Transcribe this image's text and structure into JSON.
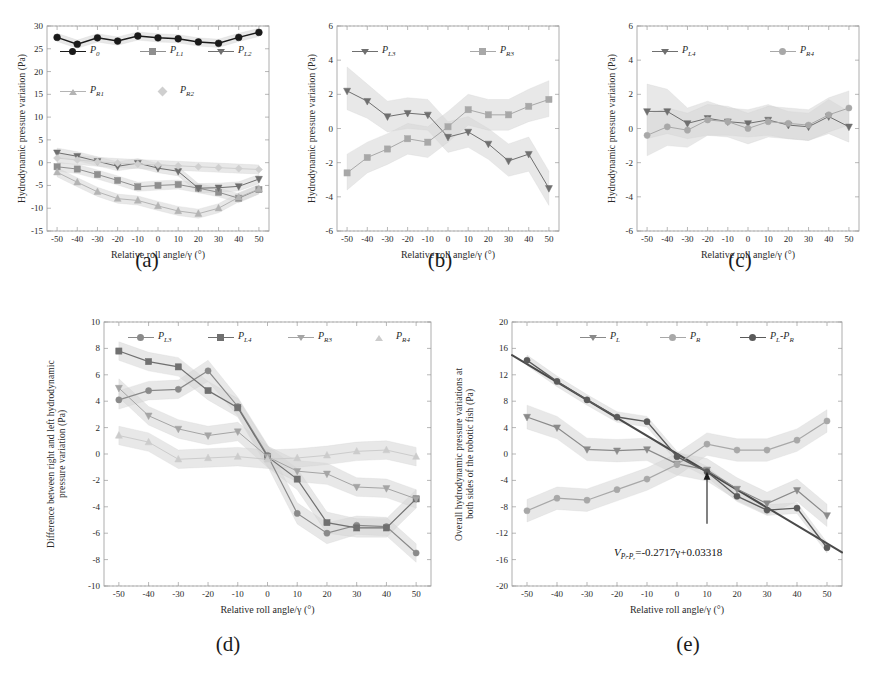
{
  "figure": {
    "axis_x_label": "Relative roll angle/γ (°)",
    "x_ticks": [
      "-50",
      "-40",
      "-30",
      "-20",
      "-10",
      "0",
      "10",
      "20",
      "30",
      "40",
      "50"
    ],
    "panel_labels": {
      "a": "(a)",
      "b": "(b)",
      "c": "(c)",
      "d": "(d)",
      "e": "(e)"
    }
  },
  "colors": {
    "black": "#1a1a1a",
    "gray_dark": "#6f6f6f",
    "gray_mid": "#8f8f8f",
    "gray_light": "#b4b4b4",
    "gray_faint": "#cfcfcf",
    "band": "#d9d9d9",
    "frame": "#9a9a9a"
  },
  "chart_data": [
    {
      "id": "panel_a",
      "type": "line",
      "title": "(a)",
      "xlabel": "Relative roll angle/γ (°)",
      "ylabel": "Hydrodynamic pressure variation (Pa)",
      "x": [
        -50,
        -40,
        -30,
        -20,
        -10,
        0,
        10,
        20,
        30,
        40,
        50
      ],
      "xlim": [
        -55,
        55
      ],
      "ylim": [
        -15,
        30
      ],
      "yticks": [
        -15,
        -10,
        -5,
        0,
        5,
        10,
        15,
        20,
        25,
        30
      ],
      "grid": false,
      "legend_position": "inside-upper",
      "series": [
        {
          "name": "P_0",
          "label": "P",
          "sub": "0",
          "values": [
            27.5,
            26.0,
            27.4,
            26.7,
            27.8,
            27.4,
            27.2,
            26.5,
            26.2,
            27.5,
            28.6
          ],
          "band_lo": [
            26.6,
            25.1,
            26.5,
            25.8,
            26.9,
            26.5,
            26.3,
            25.6,
            25.3,
            26.6,
            27.7
          ],
          "band_hi": [
            28.4,
            26.9,
            28.3,
            27.6,
            28.7,
            28.3,
            28.1,
            27.4,
            27.1,
            28.4,
            29.5
          ],
          "color": "#1a1a1a",
          "marker": "circle",
          "width": 1.5
        },
        {
          "name": "P_L1",
          "label": "P",
          "sub": "L1",
          "values": [
            -0.9,
            -1.4,
            -2.6,
            -3.9,
            -5.3,
            -5.0,
            -4.8,
            -5.6,
            -6.5,
            -7.8,
            -5.9
          ],
          "band_lo": [
            -1.9,
            -2.4,
            -3.6,
            -4.9,
            -6.3,
            -6.0,
            -5.8,
            -6.6,
            -7.5,
            -8.8,
            -6.9
          ],
          "band_hi": [
            0.1,
            -0.4,
            -1.6,
            -2.9,
            -4.3,
            -4.0,
            -3.8,
            -4.6,
            -5.5,
            -6.8,
            -4.9
          ],
          "color": "#8f8f8f",
          "marker": "square",
          "width": 1.0
        },
        {
          "name": "P_L2",
          "label": "P",
          "sub": "L2",
          "values": [
            2.2,
            1.4,
            0.3,
            -0.8,
            -0.1,
            -1.2,
            -1.9,
            -5.6,
            -5.5,
            -5.2,
            -3.6
          ],
          "band_lo": [
            1.2,
            0.4,
            -0.7,
            -1.8,
            -1.1,
            -2.2,
            -2.9,
            -6.6,
            -6.5,
            -6.2,
            -4.6
          ],
          "band_hi": [
            3.2,
            2.4,
            1.3,
            0.2,
            0.9,
            -0.2,
            -0.9,
            -4.6,
            -4.5,
            -4.2,
            -2.6
          ],
          "color": "#6f6f6f",
          "marker": "triangle-down",
          "width": 1.0
        },
        {
          "name": "P_R1",
          "label": "P",
          "sub": "R1",
          "values": [
            -2.1,
            -4.3,
            -6.4,
            -7.9,
            -8.3,
            -9.5,
            -10.6,
            -11.2,
            -10.0,
            -7.6,
            -5.8
          ],
          "band_lo": [
            -3.1,
            -5.3,
            -7.4,
            -8.9,
            -9.3,
            -10.5,
            -11.6,
            -12.2,
            -11.0,
            -8.6,
            -6.8
          ],
          "band_hi": [
            -1.1,
            -3.3,
            -5.4,
            -6.9,
            -7.3,
            -8.5,
            -9.6,
            -10.2,
            -9.0,
            -6.6,
            -4.8
          ],
          "color": "#b4b4b4",
          "marker": "triangle-up",
          "width": 1.0
        },
        {
          "name": "P_R2",
          "label": "P",
          "sub": "R2",
          "values": [
            1.0,
            0.6,
            0.2,
            -0.1,
            -0.3,
            -0.5,
            -0.7,
            -0.9,
            -1.1,
            -1.3,
            -1.5
          ],
          "band_lo": [
            0.0,
            -0.4,
            -0.8,
            -1.1,
            -1.3,
            -1.5,
            -1.7,
            -1.9,
            -2.1,
            -2.3,
            -2.5
          ],
          "band_hi": [
            2.0,
            1.6,
            1.2,
            0.9,
            0.7,
            0.5,
            0.3,
            0.1,
            -0.1,
            -0.3,
            -0.5
          ],
          "color": "#cfcfcf",
          "marker": "diamond",
          "width": 1.0
        }
      ]
    },
    {
      "id": "panel_b",
      "type": "line",
      "title": "(b)",
      "xlabel": "Relative roll angle/γ (°)",
      "ylabel": "Hydrodynamic pressure variation (Pa)",
      "x": [
        -50,
        -40,
        -30,
        -20,
        -10,
        0,
        10,
        20,
        30,
        40,
        50
      ],
      "xlim": [
        -55,
        55
      ],
      "ylim": [
        -6,
        6
      ],
      "yticks": [
        -6,
        -4,
        -2,
        0,
        2,
        4,
        6
      ],
      "grid": false,
      "legend_position": "inside-upper",
      "series": [
        {
          "name": "P_L3",
          "label": "P",
          "sub": "L3",
          "values": [
            2.2,
            1.6,
            0.7,
            0.9,
            0.8,
            -0.5,
            -0.2,
            -0.9,
            -1.9,
            -1.5,
            -3.5
          ],
          "band_lo": [
            1.1,
            0.6,
            -0.2,
            0.0,
            -0.1,
            -1.4,
            -1.1,
            -1.8,
            -2.8,
            -2.5,
            -4.5
          ],
          "band_hi": [
            3.6,
            2.6,
            1.6,
            1.8,
            1.7,
            0.4,
            0.7,
            0.0,
            -0.9,
            -0.5,
            -2.5
          ],
          "color": "#6f6f6f",
          "marker": "triangle-down",
          "width": 1.0
        },
        {
          "name": "P_R3",
          "label": "P",
          "sub": "R3",
          "values": [
            -2.6,
            -1.7,
            -1.2,
            -0.6,
            -0.8,
            0.1,
            1.1,
            0.8,
            0.8,
            1.3,
            1.7
          ],
          "band_lo": [
            -3.6,
            -2.6,
            -2.1,
            -1.5,
            -1.7,
            -0.8,
            0.2,
            -0.1,
            -0.1,
            0.4,
            0.7
          ],
          "band_hi": [
            -1.5,
            -0.8,
            -0.3,
            0.3,
            0.1,
            1.0,
            2.0,
            1.7,
            1.7,
            2.3,
            2.8
          ],
          "color": "#a8a8a8",
          "marker": "square",
          "width": 1.0
        }
      ]
    },
    {
      "id": "panel_c",
      "type": "line",
      "title": "(c)",
      "xlabel": "Relative roll angle/γ (°)",
      "ylabel": "Hydrodynamic pressure variation (Pa)",
      "x": [
        -50,
        -40,
        -30,
        -20,
        -10,
        0,
        10,
        20,
        30,
        40,
        50
      ],
      "xlim": [
        -55,
        55
      ],
      "ylim": [
        -6,
        6
      ],
      "yticks": [
        -6,
        -4,
        -2,
        0,
        2,
        4,
        6
      ],
      "grid": false,
      "legend_position": "inside-upper",
      "series": [
        {
          "name": "P_L4",
          "label": "P",
          "sub": "L4",
          "values": [
            1.0,
            1.0,
            0.3,
            0.6,
            0.4,
            0.3,
            0.5,
            0.2,
            0.1,
            0.7,
            0.1
          ],
          "band_lo": [
            -0.6,
            -0.3,
            -0.6,
            -0.4,
            -0.4,
            -0.5,
            -0.4,
            -0.6,
            -0.7,
            -0.3,
            -0.8
          ],
          "band_hi": [
            2.6,
            2.3,
            1.2,
            1.6,
            1.2,
            1.1,
            1.4,
            1.0,
            0.9,
            1.7,
            1.0
          ],
          "color": "#6f6f6f",
          "marker": "triangle-down",
          "width": 1.0
        },
        {
          "name": "P_R4",
          "label": "P",
          "sub": "R4",
          "values": [
            -0.4,
            0.1,
            -0.1,
            0.5,
            0.4,
            0.0,
            0.4,
            0.3,
            0.2,
            0.8,
            1.2
          ],
          "band_lo": [
            -1.6,
            -1.0,
            -1.1,
            -0.4,
            -0.5,
            -0.9,
            -0.5,
            -0.6,
            -0.7,
            -0.2,
            0.2
          ],
          "band_hi": [
            0.8,
            1.2,
            0.9,
            1.4,
            1.3,
            0.9,
            1.3,
            1.2,
            1.1,
            1.8,
            2.2
          ],
          "color": "#a8a8a8",
          "marker": "circle",
          "width": 1.0
        }
      ]
    },
    {
      "id": "panel_d",
      "type": "line",
      "title": "(d)",
      "xlabel": "Relative roll angle/γ (°)",
      "ylabel": "Difference between right and left hydrodynamic\npressure variation (Pa)",
      "x": [
        -50,
        -40,
        -30,
        -20,
        -10,
        0,
        10,
        20,
        30,
        40,
        50
      ],
      "xlim": [
        -55,
        55
      ],
      "ylim": [
        -10,
        10
      ],
      "yticks": [
        -10,
        -8,
        -6,
        -4,
        -2,
        0,
        2,
        4,
        6,
        8,
        10
      ],
      "grid": false,
      "legend_position": "inside-top",
      "series": [
        {
          "name": "P_L3",
          "label": "P",
          "sub": "L3",
          "values": [
            4.1,
            4.8,
            4.9,
            6.3,
            3.6,
            -0.1,
            -4.5,
            -6.0,
            -5.4,
            -5.5,
            -7.5
          ],
          "band_lo": [
            3.4,
            4.1,
            4.2,
            5.5,
            2.9,
            -0.9,
            -5.3,
            -6.8,
            -6.1,
            -6.2,
            -8.2
          ],
          "band_hi": [
            4.8,
            5.5,
            5.6,
            7.1,
            4.3,
            0.7,
            -3.7,
            -5.2,
            -4.7,
            -4.8,
            -6.8
          ],
          "color": "#8a8a8a",
          "marker": "circle",
          "width": 1.2
        },
        {
          "name": "P_L4",
          "label": "P",
          "sub": "L4",
          "values": [
            7.8,
            7.0,
            6.6,
            4.8,
            3.5,
            -0.2,
            -1.9,
            -5.2,
            -5.6,
            -5.6,
            -3.4
          ],
          "band_lo": [
            7.1,
            6.3,
            5.9,
            4.1,
            2.8,
            -1.0,
            -2.7,
            -6.0,
            -6.3,
            -6.3,
            -4.1
          ],
          "band_hi": [
            8.5,
            7.7,
            7.3,
            5.5,
            4.2,
            0.6,
            -1.1,
            -4.4,
            -4.9,
            -4.9,
            -2.7
          ],
          "color": "#707070",
          "marker": "square",
          "width": 1.2
        },
        {
          "name": "P_R3",
          "label": "P",
          "sub": "R3",
          "values": [
            5.0,
            2.9,
            1.9,
            1.4,
            1.7,
            -0.2,
            -1.3,
            -1.5,
            -2.5,
            -2.6,
            -3.4
          ],
          "band_lo": [
            4.3,
            2.2,
            1.2,
            0.7,
            1.0,
            -1.0,
            -2.1,
            -2.3,
            -3.2,
            -3.3,
            -4.1
          ],
          "band_hi": [
            5.7,
            3.6,
            2.6,
            2.1,
            2.4,
            0.6,
            -0.5,
            -0.7,
            -1.8,
            -1.9,
            -2.7
          ],
          "color": "#a5a5a5",
          "marker": "triangle-down",
          "width": 1.0
        },
        {
          "name": "P_R4",
          "label": "P",
          "sub": "R4",
          "values": [
            1.4,
            0.9,
            -0.4,
            -0.3,
            -0.2,
            -0.4,
            -0.3,
            -0.1,
            0.2,
            0.3,
            -0.2
          ],
          "band_lo": [
            0.7,
            0.2,
            -1.1,
            -1.0,
            -0.9,
            -1.1,
            -1.0,
            -0.8,
            -0.5,
            -0.4,
            -0.9
          ],
          "band_hi": [
            2.1,
            1.6,
            0.3,
            0.4,
            0.5,
            0.3,
            0.4,
            0.6,
            0.9,
            1.0,
            0.5
          ],
          "color": "#cccccc",
          "marker": "triangle-up",
          "width": 1.0
        }
      ]
    },
    {
      "id": "panel_e",
      "type": "line",
      "title": "(e)",
      "xlabel": "Relative roll angle/γ (°)",
      "ylabel": "Overall hydrodynamic pressure variations at\nboth sides of the robotic fish (Pa)",
      "x": [
        -50,
        -40,
        -30,
        -20,
        -10,
        0,
        10,
        20,
        30,
        40,
        50
      ],
      "xlim": [
        -55,
        55
      ],
      "ylim": [
        -20,
        20
      ],
      "yticks": [
        -20,
        -16,
        -12,
        -8,
        -4,
        0,
        4,
        8,
        12,
        16,
        20
      ],
      "grid": false,
      "legend_position": "inside-top",
      "annotation": {
        "text_lhs": "V",
        "text_sub": "Pₗ-Pᵣ",
        "text_rhs": "=-0.2717γ+0.03318",
        "point_x": 10,
        "point_y": -2.7
      },
      "fit_line": {
        "slope": -0.2717,
        "intercept": 0.03318,
        "color": "#4a4a4a",
        "width": 2.0
      },
      "series": [
        {
          "name": "P_L",
          "label": "P",
          "sub": "L",
          "values": [
            5.6,
            4.0,
            0.7,
            0.5,
            0.7,
            -1.5,
            -2.4,
            -5.3,
            -7.5,
            -5.5,
            -9.3
          ],
          "band_lo": [
            3.8,
            2.3,
            -1.0,
            -1.2,
            -1.0,
            -3.2,
            -4.1,
            -7.0,
            -9.2,
            -7.2,
            -11.0
          ],
          "band_hi": [
            7.4,
            5.7,
            2.4,
            2.2,
            2.4,
            0.2,
            -0.7,
            -3.6,
            -5.8,
            -3.8,
            -7.6
          ],
          "color": "#8a8a8a",
          "marker": "triangle-down",
          "width": 1.2
        },
        {
          "name": "P_R",
          "label": "P",
          "sub": "R",
          "values": [
            -8.6,
            -6.7,
            -7.0,
            -5.4,
            -3.8,
            -1.6,
            1.5,
            0.6,
            0.6,
            2.1,
            5.0
          ],
          "band_lo": [
            -10.3,
            -8.4,
            -8.7,
            -7.1,
            -5.5,
            -3.3,
            -0.2,
            -1.1,
            -1.1,
            0.4,
            3.3
          ],
          "band_hi": [
            -6.9,
            -5.0,
            -5.3,
            -3.7,
            -2.1,
            0.1,
            3.2,
            2.3,
            2.3,
            3.8,
            6.7
          ],
          "color": "#a8a8a8",
          "marker": "circle",
          "width": 1.2
        },
        {
          "name": "P_L-P_R",
          "label": "P",
          "sub": "L",
          "label2": "-P",
          "sub2": "R",
          "values": [
            14.2,
            11.0,
            8.2,
            5.6,
            4.9,
            -0.4,
            -2.7,
            -6.4,
            -8.5,
            -8.2,
            -14.2
          ],
          "band_lo": [
            13.4,
            10.2,
            7.4,
            4.8,
            4.1,
            -1.2,
            -3.5,
            -7.2,
            -9.3,
            -9.0,
            -15.0
          ],
          "band_hi": [
            15.0,
            11.8,
            9.0,
            6.4,
            5.7,
            0.4,
            -1.9,
            -5.6,
            -7.7,
            -7.4,
            -13.4
          ],
          "color": "#5a5a5a",
          "marker": "circle",
          "width": 1.4
        }
      ]
    }
  ]
}
